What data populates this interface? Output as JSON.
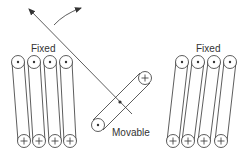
{
  "diagram": {
    "type": "electrodynamometer coil schematic",
    "stroke_color": "#333333",
    "background": "#ffffff",
    "labels": {
      "fixed_left": "Fixed",
      "fixed_right": "Fixed",
      "movable": "Movable"
    },
    "symbols": {
      "current_out": "dot",
      "current_in": "plus"
    },
    "fixed_coil_left": {
      "label": "Fixed",
      "conductors": 4,
      "top_symbols": [
        "dot",
        "dot",
        "dot",
        "dot"
      ],
      "bottom_symbols": [
        "plus",
        "plus",
        "plus",
        "plus"
      ]
    },
    "fixed_coil_right": {
      "label": "Fixed",
      "conductors": 4,
      "top_symbols": [
        "dot",
        "dot",
        "dot",
        "dot"
      ],
      "bottom_symbols": [
        "plus",
        "plus",
        "plus",
        "plus"
      ]
    },
    "movable_coil": {
      "label": "Movable",
      "end_symbols": [
        "dot",
        "plus"
      ]
    },
    "arrows": {
      "pointer": "straight arrow (pointer / axis of deflection)",
      "rotation": "curved arrow (direction of rotation)"
    }
  }
}
